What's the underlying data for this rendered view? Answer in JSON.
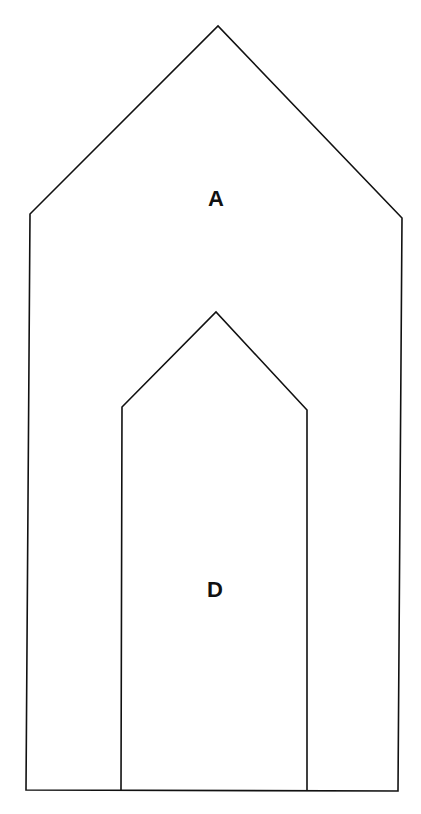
{
  "diagram": {
    "shapes": [
      {
        "id": "A",
        "label": "A",
        "points": "26,790 30,214 218,26 402,218 398,791"
      },
      {
        "id": "D",
        "label": "D",
        "points": "121,790 122,407 216,312 307,410 307,791"
      }
    ],
    "labels": {
      "outer": "A",
      "inner": "D"
    },
    "stroke_color": "#111111"
  }
}
